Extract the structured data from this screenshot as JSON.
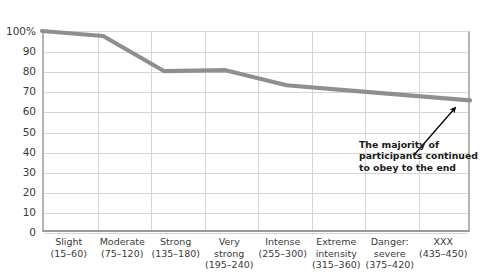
{
  "chart_data": {
    "type": "line",
    "title": "",
    "subtitle": "",
    "xlabel": "",
    "ylabel": "",
    "categories": [
      "Slight (15–60)",
      "Moderate (75–120)",
      "Strong (135–180)",
      "Very strong (195–240)",
      "Intense (255–300)",
      "Extreme intensity (315–360)",
      "Danger: severe (375–420)",
      "XXX (435–450)"
    ],
    "values": [
      100,
      97.5,
      80,
      80.5,
      73,
      70.5,
      68,
      65.5
    ],
    "series": [
      {
        "name": "Percent of participants continuing",
        "values": [
          100,
          97.5,
          80,
          80.5,
          73,
          70.5,
          68,
          65.5
        ]
      }
    ],
    "ylim": [
      0,
      100
    ],
    "ytick_values": [
      100,
      90,
      80,
      70,
      60,
      50,
      40,
      30,
      20,
      10,
      0
    ],
    "ytick_labels": [
      "100%",
      "90",
      "80",
      "70",
      "60",
      "50",
      "40",
      "30",
      "20",
      "10",
      "0"
    ],
    "grid": true,
    "legend_position": "none",
    "line_color": "#8f8f8f",
    "grid_color": "#d5d5d5",
    "axis_color": "#9a9a9a",
    "text_color": "#3a3a3a",
    "annotations": [
      {
        "lines": [
          "The majority of",
          "participants continued",
          "to obey to the end"
        ],
        "arrow": true
      }
    ]
  },
  "axes": {
    "y_ticks": [
      {
        "label": "100%",
        "value": 100
      },
      {
        "label": "90",
        "value": 90
      },
      {
        "label": "80",
        "value": 80
      },
      {
        "label": "70",
        "value": 70
      },
      {
        "label": "60",
        "value": 60
      },
      {
        "label": "50",
        "value": 50
      },
      {
        "label": "40",
        "value": 40
      },
      {
        "label": "30",
        "value": 30
      },
      {
        "label": "20",
        "value": 20
      },
      {
        "label": "10",
        "value": 10
      },
      {
        "label": "0",
        "value": 0
      }
    ],
    "x_ticks": [
      {
        "lines": [
          "Slight",
          "(15–60)"
        ]
      },
      {
        "lines": [
          "Moderate",
          "(75–120)"
        ]
      },
      {
        "lines": [
          "Strong",
          "(135–180)"
        ]
      },
      {
        "lines": [
          "Very",
          "strong",
          "(195–240)"
        ]
      },
      {
        "lines": [
          "Intense",
          "(255–300)"
        ]
      },
      {
        "lines": [
          "Extreme",
          "intensity",
          "(315–360)"
        ]
      },
      {
        "lines": [
          "Danger:",
          "severe",
          "(375–420)"
        ]
      },
      {
        "lines": [
          "XXX",
          "(435–450)"
        ]
      }
    ]
  },
  "annotation": {
    "line1": "The majority of",
    "line2": "participants continued",
    "line3": "to obey to the end"
  }
}
